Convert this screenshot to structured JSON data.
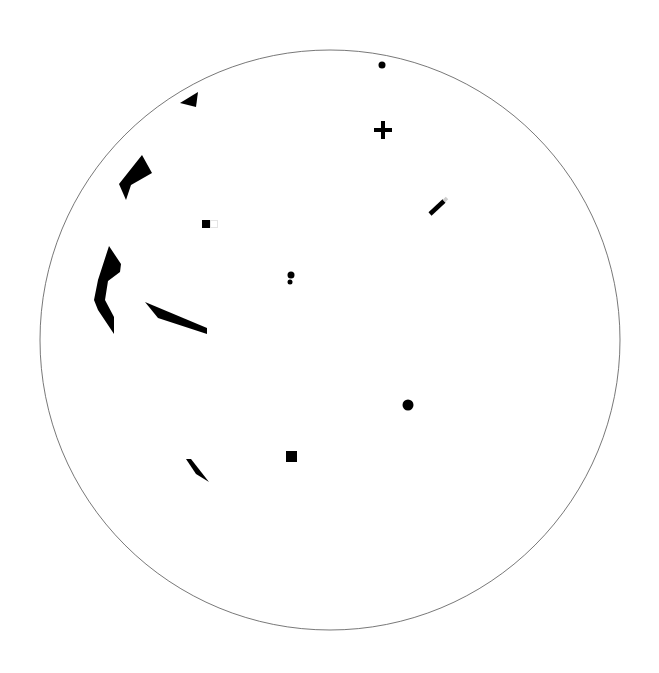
{
  "canvas": {
    "width": 659,
    "height": 673,
    "background": "#ffffff"
  },
  "boundary": {
    "shape": "circle",
    "cx": 330,
    "cy": 340,
    "r": 290,
    "stroke": "#555555",
    "stroke_width": 0.8
  },
  "fill_color": "#000000",
  "shapes": [
    {
      "name": "triangle-top-left",
      "type": "polygon",
      "points": "180,103 198,92 196,107"
    },
    {
      "name": "bent-shard-upper-left",
      "type": "polygon",
      "points": "142,155 152,173 131,185 126,200 119,184"
    },
    {
      "name": "curved-shard-left",
      "type": "polygon",
      "points": "109,246 121,264 120,272 108,281 105,300 114,317 114,334 98,310 94,300 98,280"
    },
    {
      "name": "long-wedge-left",
      "type": "polygon",
      "points": "145,302 207,328 207,334 158,318"
    },
    {
      "name": "small-wedge-lower-left",
      "type": "polygon",
      "points": "186,459 191,459 209,482 196,474"
    }
  ],
  "markers": [
    {
      "name": "dot-top",
      "type": "circle",
      "cx": 382,
      "cy": 65,
      "r": 3.5
    },
    {
      "name": "plus-sign",
      "type": "plus",
      "cx": 383,
      "cy": 130,
      "size": 18,
      "thickness": 4
    },
    {
      "name": "diagonal-bar",
      "type": "line",
      "x1": 430,
      "y1": 214,
      "x2": 444,
      "y2": 201,
      "width": 4.5
    },
    {
      "name": "square-with-outline",
      "type": "square",
      "x": 202,
      "y": 220,
      "size": 8,
      "outline_x": 210,
      "outline_w": 8
    },
    {
      "name": "double-dot-center",
      "type": "dots",
      "points": [
        [
          291,
          275,
          3.5
        ],
        [
          290,
          282,
          2.5
        ]
      ]
    },
    {
      "name": "dot-right",
      "type": "circle",
      "cx": 408,
      "cy": 405,
      "r": 5.5
    },
    {
      "name": "square-bottom",
      "type": "square",
      "x": 286,
      "y": 451,
      "size": 11
    }
  ]
}
